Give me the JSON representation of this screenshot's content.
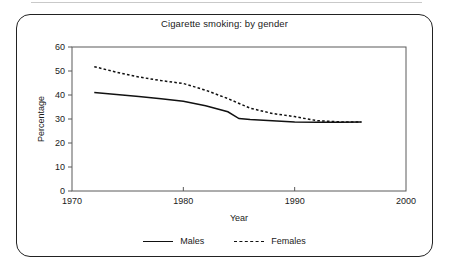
{
  "chart_data": {
    "type": "line",
    "title": "Cigarette smoking: by gender",
    "xlabel": "Year",
    "ylabel": "Percentage",
    "xlim": [
      1970,
      2000
    ],
    "ylim": [
      0,
      60
    ],
    "xticks": [
      1970,
      1980,
      1990,
      2000
    ],
    "yticks": [
      0,
      10,
      20,
      30,
      40,
      50,
      60
    ],
    "grid": false,
    "legend_position": "bottom",
    "series": [
      {
        "name": "Males",
        "style": "solid",
        "color": "#111111",
        "x": [
          1972,
          1974,
          1976,
          1978,
          1980,
          1982,
          1984,
          1985,
          1986,
          1988,
          1990,
          1992,
          1994,
          1996
        ],
        "values": [
          41,
          40.2,
          39.4,
          38.4,
          37.4,
          35.5,
          33.0,
          30.2,
          29.8,
          29.3,
          28.8,
          28.6,
          28.6,
          28.7
        ]
      },
      {
        "name": "Females",
        "style": "dotted",
        "color": "#111111",
        "x": [
          1972,
          1974,
          1976,
          1978,
          1980,
          1982,
          1984,
          1986,
          1988,
          1990,
          1992,
          1994,
          1996
        ],
        "values": [
          51.8,
          49.5,
          47.5,
          46.0,
          44.8,
          42.0,
          38.5,
          34.5,
          32.3,
          31.0,
          29.3,
          28.8,
          28.8
        ]
      }
    ]
  },
  "legend": {
    "items": [
      {
        "label": "Males",
        "style": "solid"
      },
      {
        "label": "Females",
        "style": "dotted"
      }
    ]
  }
}
